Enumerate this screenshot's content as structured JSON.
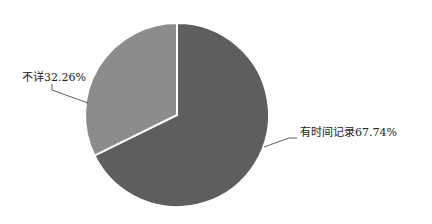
{
  "chart_data": {
    "type": "pie",
    "title": "",
    "categories": [
      "有时间记录",
      "不详"
    ],
    "values": [
      67.74,
      32.26
    ],
    "unit": "%",
    "colors": [
      "#5e5e5e",
      "#8c8c8c"
    ],
    "start_angle_deg": 0,
    "direction": "clockwise",
    "legend": "none",
    "data_labels": [
      "有时间记录67.74%",
      "不详32.26%"
    ]
  },
  "labels": {
    "slice_0": "有时间记录67.74%",
    "slice_1": "不详32.26%"
  }
}
